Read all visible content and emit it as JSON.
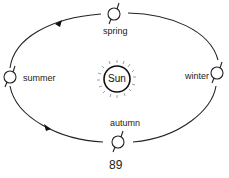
{
  "diagram": {
    "center": {
      "label": "Sun"
    },
    "seasons": [
      {
        "label": "spring"
      },
      {
        "label": "summer"
      },
      {
        "label": "autumn"
      },
      {
        "label": "winter"
      }
    ],
    "orbit_direction": "counterclockwise",
    "page_number": "89"
  }
}
